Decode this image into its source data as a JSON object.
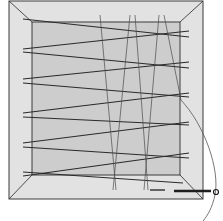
{
  "figure": {
    "colors": {
      "background": "#ffffff",
      "outer_frame_fill": "#e2e2e2",
      "inner_panel_fill": "#cdcdcd",
      "frame_line": "#3a3a3a",
      "thread": "#2a2a2a",
      "warp_thread": "#4a4a4a",
      "needle": "#1e1e1e",
      "tail_curve": "#555555"
    },
    "outer_frame": {
      "x1": 9,
      "y1": 1,
      "x2": 203,
      "y2": 90
    },
    "outer_bottom": 199,
    "inner_panel": {
      "x1": 32,
      "y1": 22,
      "x2": 180,
      "y2": 175
    },
    "weft_threads": [
      {
        "x1": 23,
        "y1": 19,
        "x2": 189,
        "y2": 37
      },
      {
        "x1": 23,
        "y1": 49,
        "x2": 189,
        "y2": 31
      },
      {
        "x1": 23,
        "y1": 52,
        "x2": 189,
        "y2": 68
      },
      {
        "x1": 23,
        "y1": 79,
        "x2": 189,
        "y2": 62
      },
      {
        "x1": 23,
        "y1": 83,
        "x2": 189,
        "y2": 97
      },
      {
        "x1": 23,
        "y1": 113,
        "x2": 189,
        "y2": 93
      },
      {
        "x1": 23,
        "y1": 117,
        "x2": 189,
        "y2": 125
      },
      {
        "x1": 23,
        "y1": 143,
        "x2": 189,
        "y2": 122
      },
      {
        "x1": 23,
        "y1": 147,
        "x2": 189,
        "y2": 158
      },
      {
        "x1": 23,
        "y1": 176,
        "x2": 189,
        "y2": 153
      },
      {
        "x1": 23,
        "y1": 172,
        "x2": 183,
        "y2": 183
      }
    ],
    "warp_threads": [
      {
        "x1": 100,
        "y1": 15,
        "x2": 116,
        "y2": 190
      },
      {
        "x1": 130,
        "y1": 15,
        "x2": 113,
        "y2": 190
      },
      {
        "x1": 135,
        "y1": 15,
        "x2": 148,
        "y2": 190
      },
      {
        "x1": 159,
        "y1": 15,
        "x2": 144,
        "y2": 190
      },
      {
        "x1": 164,
        "y1": 15,
        "x2": 181,
        "y2": 100
      }
    ],
    "needle_dashes": [
      {
        "x1": 150,
        "y1": 190,
        "x2": 165,
        "y2": 190
      },
      {
        "x1": 174,
        "y1": 191,
        "x2": 211,
        "y2": 191
      }
    ],
    "needle_eye": {
      "cx": 216,
      "cy": 192,
      "r": 2.5
    },
    "tail_curve": "M 180 99 C 205 125, 220 170, 215 195 C 212 208, 208 215, 203 221"
  }
}
